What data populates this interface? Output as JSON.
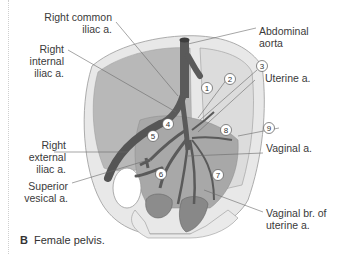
{
  "figure": {
    "caption_letter": "B",
    "caption_text": "Female pelvis.",
    "colors": {
      "artery": "#5a5a5a",
      "bone": "#e6e6e6",
      "bone_outline": "#9a9a9a",
      "muscle": "#b5b5b5",
      "organ": "#8a8a8a",
      "leader": "#6a6a6a",
      "text": "#3a3a3a"
    }
  },
  "labels": {
    "right_common_iliac": [
      "Right common",
      "iliac a."
    ],
    "right_internal_iliac": [
      "Right",
      "internal",
      "iliac a."
    ],
    "right_external_iliac": [
      "Right",
      "external",
      "iliac a."
    ],
    "superior_vesical": [
      "Superior",
      "vesical a."
    ],
    "abdominal_aorta": [
      "Abdominal",
      "aorta"
    ],
    "uterine": [
      "Uterine a."
    ],
    "vaginal": [
      "Vaginal a."
    ],
    "vaginal_branch": [
      "Vaginal br. of",
      "uterine a."
    ]
  },
  "markers": [
    "1",
    "2",
    "3",
    "4",
    "5",
    "6",
    "7",
    "8",
    "9"
  ]
}
